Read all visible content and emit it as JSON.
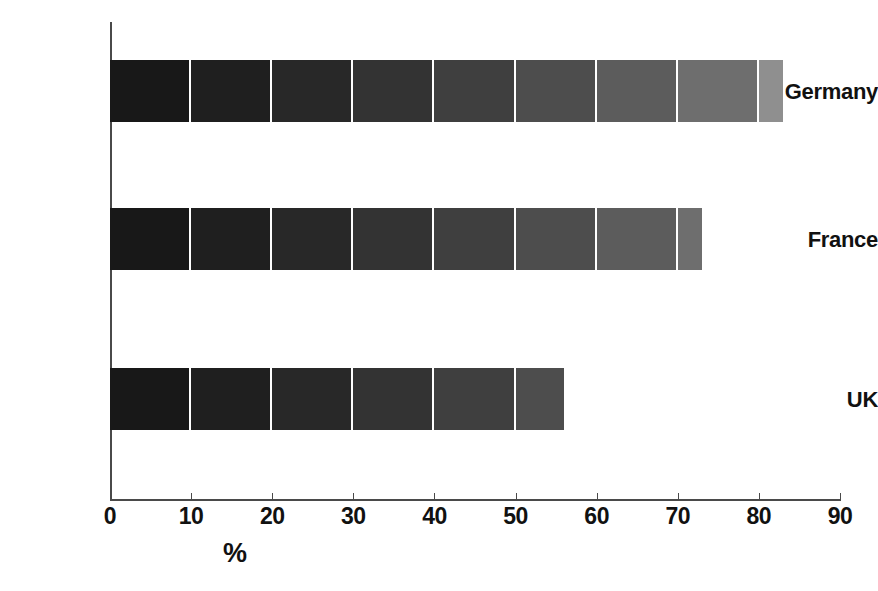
{
  "chart_data": {
    "type": "bar",
    "orientation": "horizontal",
    "title": "",
    "xlabel": "%",
    "ylabel": "",
    "categories": [
      "Germany",
      "France",
      "UK"
    ],
    "values": [
      83,
      73,
      56
    ],
    "series": [
      {
        "name": "percentage",
        "values": [
          83,
          73,
          56
        ]
      }
    ],
    "xlim": [
      0,
      90
    ],
    "xticks": [
      0,
      10,
      20,
      30,
      40,
      50,
      60,
      70,
      80,
      90
    ],
    "xtick_labels": [
      "0",
      "10",
      "20",
      "30",
      "40",
      "50",
      "60",
      "70",
      "80",
      "90"
    ],
    "grid": true,
    "grid_axis": "x",
    "grid_color": "#ffffff",
    "legend": false,
    "bar_fill": "grayscale-gradient-left-dark-to-right-light",
    "segment_colors": [
      "#181818",
      "#1f1f1f",
      "#282828",
      "#333333",
      "#3f3f3f",
      "#4d4d4d",
      "#5c5c5c",
      "#6e6e6e",
      "#8f8f8f"
    ],
    "axis_color": "#4a4a4a",
    "background": "#ffffff"
  },
  "axis": {
    "x_title": "%"
  }
}
